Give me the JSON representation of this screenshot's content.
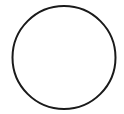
{
  "shape": {
    "type": "circle",
    "cx": 64,
    "cy": 57.5,
    "r": 51.5,
    "stroke": "#1a1a1a",
    "stroke_width": 2,
    "fill": "#ffffff"
  }
}
